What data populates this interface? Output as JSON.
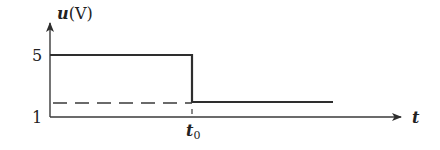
{
  "diagram": {
    "type": "step-voltage-waveform",
    "y_axis": {
      "variable": "u",
      "unit": "(V)",
      "tick_labels": [
        "5",
        "1"
      ]
    },
    "x_axis": {
      "variable": "t",
      "tick_label_main": "t",
      "tick_label_sub": "0"
    },
    "signal": {
      "high_level": 5,
      "low_level": 1.3,
      "transition_at": "t0",
      "description": "u = 5 V for t < t0, drops to lower constant level after t0"
    },
    "reference_line": {
      "style": "dashed",
      "level_matches": "signal low level"
    },
    "colors": {
      "line": "#2e2e2e",
      "text": "#222222",
      "background": "#ffffff"
    }
  }
}
